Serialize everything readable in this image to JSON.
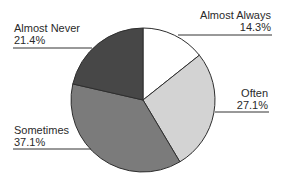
{
  "chart_data": {
    "type": "pie",
    "title": "",
    "start_angle": "top (12 o'clock), clockwise",
    "slices": [
      {
        "label": "Almost Always",
        "value": 14.3,
        "value_label": "14.3%",
        "color": "#ffffff"
      },
      {
        "label": "Often",
        "value": 27.1,
        "value_label": "27.1%",
        "color": "#d3d3d3"
      },
      {
        "label": "Sometimes",
        "value": 37.1,
        "value_label": "37.1%",
        "color": "#7b7b7b"
      },
      {
        "label": "Almost Never",
        "value": 21.4,
        "value_label": "21.4%",
        "color": "#474747"
      }
    ],
    "legend": "none (labels with leader lines)",
    "outline_color": "#2e2e2e"
  }
}
